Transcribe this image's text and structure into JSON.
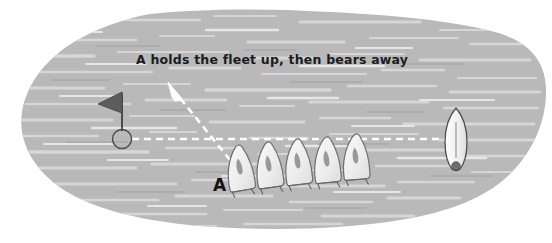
{
  "diagram": {
    "caption": "A holds the fleet up, then bears away",
    "boat_label": "A",
    "colors": {
      "water_base": "#b9b9b9",
      "water_streak_light": "#d6d6d6",
      "water_streak_pale": "#e4e4e4",
      "water_streak_dark": "#a9a9a9",
      "page_background": "#ffffff",
      "flag": "#5a5a5a",
      "flag_pole": "#3a3a3a",
      "buoy_outline": "#4a4a4a",
      "arrow": "#ffffff",
      "dashed_line": "#ffffff",
      "hull_fill": "#f2f2f2",
      "hull_outline": "#585858",
      "sail_fill": "#ededed",
      "sail_outline": "#6a6a6a",
      "crew_dot": "#6e6e6e",
      "text": "#1c1c1c"
    },
    "elements": {
      "mark_flag": {
        "name": "committee-boat-mark-flag",
        "direction": "points-left",
        "x": 122,
        "y": 110
      },
      "mark_buoy": {
        "name": "mark-buoy",
        "x": 122,
        "y": 138,
        "radius": 9
      },
      "layline": {
        "name": "dashed-layline",
        "x1": 132,
        "y1": 139,
        "x2": 448,
        "y2": 139,
        "style": "dashed"
      },
      "course_arrow": {
        "name": "course-arrow",
        "from_x": 230,
        "from_y": 160,
        "to_x": 168,
        "to_y": 82,
        "style": "dashed-with-solid-head"
      },
      "windward_boat": {
        "name": "windward-boat-overhead",
        "x": 456,
        "y": 140
      }
    },
    "fleet": {
      "name": "fleet-of-boats",
      "count": 5,
      "boats": [
        {
          "id": "boat-1",
          "x": 237,
          "y": 168,
          "rotation": -7
        },
        {
          "id": "boat-2",
          "x": 265,
          "y": 165,
          "rotation": -5
        },
        {
          "id": "boat-3",
          "x": 293,
          "y": 162,
          "rotation": -4
        },
        {
          "id": "boat-4",
          "x": 321,
          "y": 160,
          "rotation": -3
        },
        {
          "id": "boat-5",
          "x": 349,
          "y": 157,
          "rotation": -2
        }
      ]
    }
  }
}
